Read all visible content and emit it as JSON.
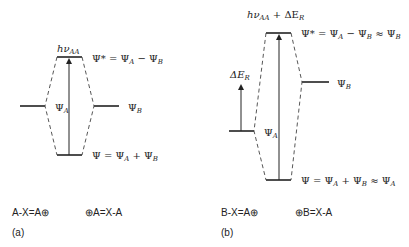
{
  "panel_a": {
    "label": "(a)",
    "transition_label": {
      "main": "hν",
      "sub": "AA"
    },
    "upper_orbital": {
      "lhs": "Ψ* = Ψ",
      "s1": "A",
      "mid": " − Ψ",
      "s2": "B"
    },
    "lower_orbital": {
      "lhs": "Ψ = Ψ",
      "s1": "A",
      "mid": " + Ψ",
      "s2": "B"
    },
    "left_level": {
      "main": "Ψ",
      "sub": "A"
    },
    "right_level": {
      "main": "Ψ",
      "sub": "B"
    },
    "resonance_left": "A-X=A⊕",
    "resonance_right": "⊕A=X-A"
  },
  "panel_b": {
    "label": "(b)",
    "transition_label": {
      "main": "hν",
      "sub": "AA",
      "plus": " + ΔE",
      "sub2": "R"
    },
    "upper_orbital": {
      "lhs": "Ψ* = Ψ",
      "s1": "A",
      "mid": " − Ψ",
      "s2": "B",
      "approx": " ≈ Ψ",
      "s3": "B"
    },
    "lower_orbital": {
      "lhs": "Ψ = Ψ",
      "s1": "A",
      "mid": " + Ψ",
      "s2": "B",
      "approx": " ≈ Ψ",
      "s3": "A"
    },
    "left_level": {
      "main": "Ψ",
      "sub": "A"
    },
    "right_level": {
      "main": "Ψ",
      "sub": "B"
    },
    "energy_gap_label": {
      "main": "ΔE",
      "sub": "R"
    },
    "resonance_left": "B-X=A⊕",
    "resonance_right": "⊕B=X-A"
  }
}
